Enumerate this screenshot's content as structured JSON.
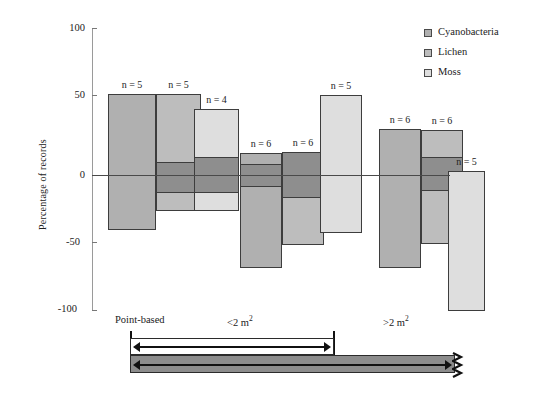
{
  "chart_data": {
    "type": "bar",
    "title": "",
    "xlabel": "",
    "ylabel": "Percentage of records",
    "ylim": [
      -100,
      100
    ],
    "yticks": [
      100,
      50,
      0,
      -50,
      -100
    ],
    "ytick_labels": [
      "100",
      "50",
      "0",
      "-50",
      "-100"
    ],
    "grid": false,
    "legend_position": "top-right",
    "note": "Box-style bars: each bar spans a min-max range with a darker interquartile band; n labels above each bar.",
    "categories": [
      "Point-based",
      "<2 m²",
      ">2 m²"
    ],
    "series": [
      {
        "name": "Cyanobacteria",
        "color": "#b0b0b0",
        "values": [
          60,
          16,
          34
        ],
        "bars": [
          {
            "group": "Point-based",
            "n": "n = 5",
            "top": 60,
            "bottom": -41,
            "band_top": 0,
            "band_bottom": 0
          },
          {
            "group": "<2 m²",
            "n": "n = 6",
            "top": 16,
            "bottom": -69,
            "band_top": 8,
            "band_bottom": -9
          },
          {
            "group": ">2 m²",
            "n": "n = 6",
            "top": 34,
            "bottom": -69,
            "band_top": 0,
            "band_bottom": 0
          }
        ]
      },
      {
        "name": "Lichen",
        "color": "#bdbdbd",
        "values": [
          60,
          17,
          33
        ],
        "bars": [
          {
            "group": "Point-based",
            "n": "n = 5",
            "top": 60,
            "bottom": -27,
            "band_top": 10,
            "band_bottom": -13
          },
          {
            "group": "<2 m²",
            "n": "n = 6",
            "top": 17,
            "bottom": -52,
            "band_top": 17,
            "band_bottom": -17
          },
          {
            "group": ">2 m²",
            "n": "n = 6",
            "top": 33,
            "bottom": -51,
            "band_top": 13,
            "band_bottom": -12
          }
        ]
      },
      {
        "name": "Moss",
        "color": "#dedede",
        "values": [
          49,
          59,
          3
        ],
        "bars": [
          {
            "group": "Point-based",
            "n": "n = 4",
            "top": 49,
            "bottom": -27,
            "band_top": 13,
            "band_bottom": -13
          },
          {
            "group": "<2 m²",
            "n": "n = 5",
            "top": 59,
            "bottom": -43,
            "band_top": 0,
            "band_bottom": 0
          },
          {
            "group": ">2 m²",
            "n": "n = 5",
            "top": 3,
            "bottom": -101,
            "band_top": 0,
            "band_bottom": 0
          }
        ]
      }
    ]
  },
  "axis": {
    "y_label": "Percentage of records",
    "tick_100": "100",
    "tick_50": "50",
    "tick_0": "0",
    "tick_neg50": "-50",
    "tick_neg100": "-100"
  },
  "legend": {
    "items": [
      {
        "label": "Cyanobacteria",
        "color": "#b0b0b0"
      },
      {
        "label": "Lichen",
        "color": "#bdbdbd"
      },
      {
        "label": "Moss",
        "color": "#dedede"
      }
    ]
  },
  "n_labels": {
    "b1": "n = 5",
    "b2": "n = 5",
    "b3": "n = 4",
    "b4": "n = 6",
    "b5": "n = 6",
    "b6": "n = 5",
    "b7": "n = 6",
    "b8": "n = 6",
    "b9": "n = 5"
  },
  "group_labels": {
    "point_based": "Point-based",
    "small_plot_prefix": "<2 m",
    "small_plot_sup": "2",
    "large_plot_prefix": ">2 m",
    "large_plot_sup": "2"
  },
  "schematic": {
    "description": "Two horizontal extent bars beneath the axis: an upper white bar with a double-headed arrow ending at the <2 m2 boundary, and a lower gray bar with a left-pointing arrow continuing past a zigzag break at the right.",
    "upper_bar_fill": "#ffffff",
    "lower_bar_fill": "#8c8c8c"
  }
}
